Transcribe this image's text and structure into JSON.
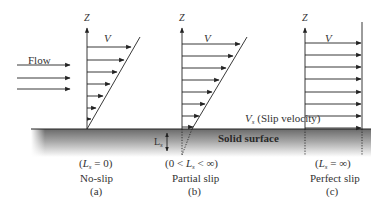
{
  "diagram": {
    "type": "slip-boundary-velocity-profiles",
    "flow_label": "Flow",
    "surface_label": "Solid surface",
    "slip_velocity_label": "(Slip velocity)",
    "slip_velocity_symbol": "V",
    "slip_velocity_subscript": "s",
    "slip_length_symbol": "L",
    "slip_length_subscript": "s",
    "axis_label": "Z",
    "velocity_label": "V",
    "panels": [
      {
        "id": "a",
        "condition_prefix": "(",
        "condition_suffix": " = 0)",
        "condition_mid": "",
        "name": "No-slip",
        "tag": "(a)"
      },
      {
        "id": "b",
        "condition_prefix": "(0 < ",
        "condition_suffix": " < ∞)",
        "condition_mid": "",
        "name": "Partial slip",
        "tag": "(b)"
      },
      {
        "id": "c",
        "condition_prefix": "(",
        "condition_suffix": " = ∞)",
        "condition_mid": "",
        "name": "Perfect slip",
        "tag": "(c)"
      }
    ]
  },
  "colors": {
    "line": "#222222",
    "surface_top": "#6e6e6e",
    "surface_bottom": "#ffffff",
    "text": "#333333"
  }
}
